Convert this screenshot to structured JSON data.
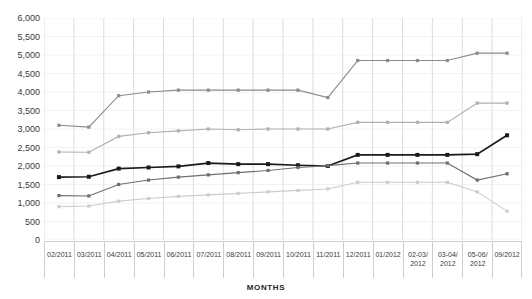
{
  "legend": {
    "items": [
      "",
      "",
      "",
      "",
      ""
    ]
  },
  "axis": {
    "x_title": "MONTHS",
    "y_ticks": [
      "6,000",
      "5,500",
      "5,000",
      "4,500",
      "4,000",
      "3,500",
      "3,000",
      "2,500",
      "2,000",
      "1,500",
      "1,000",
      "500",
      "0"
    ]
  },
  "chart_data": {
    "type": "line",
    "title": "",
    "xlabel": "MONTHS",
    "ylabel": "",
    "ylim": [
      0,
      6000
    ],
    "ytick_values": [
      0,
      500,
      1000,
      1500,
      2000,
      2500,
      3000,
      3500,
      4000,
      4500,
      5000,
      5500,
      6000
    ],
    "grid": true,
    "legend_position": "top",
    "categories": [
      "02/2011",
      "03/2011",
      "04/2011",
      "05/2011",
      "06/2011",
      "07/2011",
      "08/2011",
      "09/2011",
      "10/2011",
      "11/2011",
      "12/2011",
      "01/2012",
      "02-03/\n2012",
      "03-04/\n2012",
      "05-06/\n2012",
      "09/2012"
    ],
    "series": [
      {
        "name": "series-1",
        "color": "#8c8c8c",
        "values": [
          3100,
          3050,
          3900,
          4000,
          4050,
          4050,
          4050,
          4050,
          4050,
          3850,
          4850,
          4850,
          4850,
          4850,
          5050,
          5050
        ]
      },
      {
        "name": "series-2",
        "color": "#b0b0b0",
        "values": [
          2380,
          2370,
          2800,
          2900,
          2950,
          3000,
          2980,
          3000,
          3000,
          3000,
          3180,
          3180,
          3180,
          3180,
          3700,
          3700
        ]
      },
      {
        "name": "series-3",
        "color": "#1a1a1a",
        "values": [
          1700,
          1710,
          1930,
          1960,
          1990,
          2080,
          2050,
          2050,
          2020,
          2000,
          2300,
          2300,
          2300,
          2300,
          2320,
          2830
        ]
      },
      {
        "name": "series-4",
        "color": "#6e6e6e",
        "values": [
          1200,
          1190,
          1500,
          1620,
          1700,
          1760,
          1820,
          1880,
          1960,
          2010,
          2080,
          2080,
          2080,
          2080,
          1620,
          1790
        ]
      },
      {
        "name": "series-5",
        "color": "#cccccc",
        "values": [
          900,
          920,
          1050,
          1120,
          1180,
          1220,
          1260,
          1300,
          1340,
          1380,
          1560,
          1560,
          1560,
          1560,
          1300,
          780
        ]
      }
    ]
  }
}
